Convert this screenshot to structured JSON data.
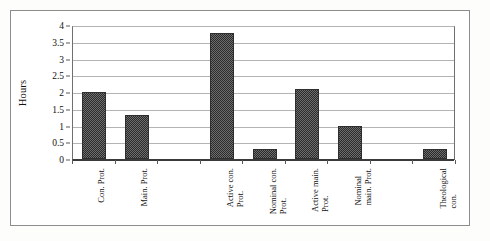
{
  "figure": {
    "background": "#ffffff",
    "frame_color": "#8d8d8d",
    "bar_fill": "#5a5a5a",
    "bar_edge": "#2e2e2e",
    "gridline_color": "#b4b4b4"
  },
  "chart_data": {
    "type": "bar",
    "title": "",
    "xlabel": "",
    "ylabel": "Hours",
    "ylim": [
      0,
      4
    ],
    "ytick_values": [
      0,
      0.5,
      1,
      1.5,
      2,
      2.5,
      3,
      3.5,
      4
    ],
    "ytick_labels": [
      "0",
      "0.5",
      "1",
      "1.5",
      "2",
      "2.5",
      "3",
      "3.5",
      "4"
    ],
    "grid": true,
    "legend": false,
    "categories": [
      "Con. Prot.",
      "Main. Prot.",
      "",
      "Active con. Prot.",
      "Nominal con. Prot.",
      "Active main. Prot.",
      "Nominal main. Prot.",
      "",
      "Theological con."
    ],
    "values": [
      2.0,
      1.3,
      null,
      3.75,
      0.3,
      2.1,
      1.0,
      null,
      0.3
    ],
    "bars": [
      {
        "label": "Con. Prot.",
        "label_lines": "Con. Prot.",
        "value": 2.0,
        "slot": 0
      },
      {
        "label": "Main. Prot.",
        "label_lines": "Main. Prot.",
        "value": 1.3,
        "slot": 1
      },
      {
        "label": "Active con. Prot.",
        "label_lines": "Active con.\nProt.",
        "value": 3.75,
        "slot": 3
      },
      {
        "label": "Nominal con. Prot.",
        "label_lines": "Nominal con.\nProt.",
        "value": 0.3,
        "slot": 4
      },
      {
        "label": "Active main. Prot.",
        "label_lines": "Active main.\nProt.",
        "value": 2.1,
        "slot": 5
      },
      {
        "label": "Nominal main. Prot.",
        "label_lines": "Nominal\nmain. Prot.",
        "value": 1.0,
        "slot": 6
      },
      {
        "label": "Theological con.",
        "label_lines": "Theological\ncon.",
        "value": 0.3,
        "slot": 8
      }
    ],
    "slot_count": 9
  }
}
